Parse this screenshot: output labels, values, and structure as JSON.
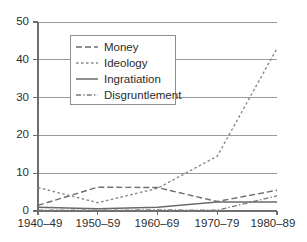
{
  "chart_data": {
    "type": "line",
    "title": "",
    "subtitle": "",
    "xlabel": "",
    "ylabel": "",
    "categories": [
      "1940–49",
      "1950–59",
      "1960–69",
      "1970–79",
      "1980–89"
    ],
    "xticks": [
      "1940–49",
      "1950–59",
      "1960–69",
      "1970–79",
      "1980–89"
    ],
    "yticks": [
      "0",
      "10",
      "20",
      "30",
      "40",
      "50"
    ],
    "ylim": [
      0,
      50
    ],
    "grid": "horizontal",
    "legend_position": "upper-left-inside",
    "series": [
      {
        "name": "Money",
        "values": [
          1.5,
          6.3,
          6.2,
          2.5,
          5.5
        ],
        "style": "dashed",
        "color": "#6e6e6e"
      },
      {
        "name": "Ideology",
        "values": [
          6.2,
          2.2,
          6.0,
          14.5,
          43.0
        ],
        "style": "dotted",
        "color": "#8a8a8a"
      },
      {
        "name": "Ingratiation",
        "values": [
          1.0,
          0.6,
          1.0,
          2.4,
          2.4
        ],
        "style": "solid",
        "color": "#6a6a6a"
      },
      {
        "name": "Disgruntlement",
        "values": [
          0.2,
          0.2,
          0.3,
          0.2,
          4.0
        ],
        "style": "dash-dot",
        "color": "#7a7a7a"
      }
    ]
  },
  "legend": {
    "entries": [
      {
        "label": "Money"
      },
      {
        "label": "Ideology"
      },
      {
        "label": "Ingratiation"
      },
      {
        "label": "Disgruntlement"
      }
    ]
  },
  "axes": {
    "y_tick_0": "0",
    "y_tick_1": "10",
    "y_tick_2": "20",
    "y_tick_3": "30",
    "y_tick_4": "40",
    "y_tick_5": "50",
    "x_tick_0": "1940–49",
    "x_tick_1": "1950–59",
    "x_tick_2": "1960–69",
    "x_tick_3": "1970–79",
    "x_tick_4": "1980–89"
  },
  "colors": {
    "axis": "#6f6f6f",
    "grid": "#8f8f8f",
    "text": "#2b2b2b",
    "legend_border": "#8d8d8d",
    "background": "#ffffff"
  }
}
